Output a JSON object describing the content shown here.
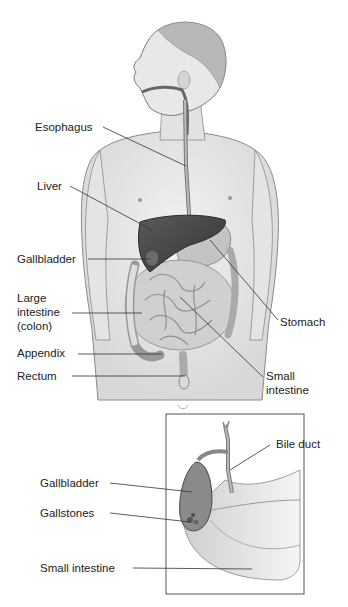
{
  "diagram": {
    "main_figure": {
      "labels": {
        "esophagus": "Esophagus",
        "liver": "Liver",
        "gallbladder": "Gallbladder",
        "large_intestine_1": "Large",
        "large_intestine_2": "intestine",
        "large_intestine_3": "(colon)",
        "appendix": "Appendix",
        "rectum": "Rectum",
        "stomach": "Stomach",
        "small_intestine_1": "Small",
        "small_intestine_2": "intestine"
      }
    },
    "inset_figure": {
      "labels": {
        "bile_duct": "Bile duct",
        "gallbladder": "Gallbladder",
        "gallstones": "Gallstones",
        "small_intestine": "Small intestine"
      }
    },
    "colors": {
      "background": "#ffffff",
      "skin": "#e6e6e6",
      "outline": "#7a7a7a",
      "liver": "#4a4a4a",
      "intestine": "#cfcfcf",
      "leader_line": "#333333",
      "inset_border": "#555555"
    }
  }
}
